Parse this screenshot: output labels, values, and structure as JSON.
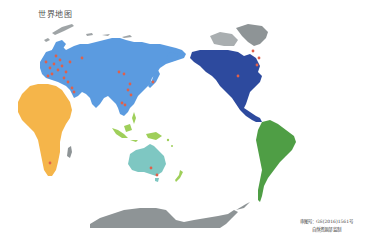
{
  "title": "世界地图",
  "footer": {
    "approval_number": "审图号：GS(2016)1561号",
    "publisher": "自然资源部 监制"
  },
  "colors": {
    "background": "#ffffff",
    "eurasia": "#5b9be0",
    "north_america": "#2d4a9e",
    "south_america": "#4f9e45",
    "africa": "#f5b54a",
    "oceania_australia": "#7ec7c2",
    "southeast_asia_islands": "#9fcf5a",
    "polar_ice": "#8e9496",
    "markers": "#e0604a"
  },
  "regions": [
    {
      "name": "Eurasia",
      "color_key": "eurasia"
    },
    {
      "name": "Africa",
      "color_key": "africa"
    },
    {
      "name": "North America",
      "color_key": "north_america"
    },
    {
      "name": "South America",
      "color_key": "south_america"
    },
    {
      "name": "Australia",
      "color_key": "oceania_australia"
    },
    {
      "name": "Southeast Asia / Pacific Islands",
      "color_key": "southeast_asia_islands"
    },
    {
      "name": "Greenland / Arctic",
      "color_key": "polar_ice"
    },
    {
      "name": "Antarctica",
      "color_key": "polar_ice"
    }
  ],
  "markers": [
    {
      "x": 46,
      "y": 62
    },
    {
      "x": 50,
      "y": 68
    },
    {
      "x": 54,
      "y": 64
    },
    {
      "x": 58,
      "y": 70
    },
    {
      "x": 62,
      "y": 66
    },
    {
      "x": 66,
      "y": 72
    },
    {
      "x": 60,
      "y": 60
    },
    {
      "x": 52,
      "y": 74
    },
    {
      "x": 70,
      "y": 62
    },
    {
      "x": 56,
      "y": 56
    },
    {
      "x": 64,
      "y": 78
    },
    {
      "x": 68,
      "y": 82
    },
    {
      "x": 48,
      "y": 76
    },
    {
      "x": 72,
      "y": 88
    },
    {
      "x": 74,
      "y": 92
    },
    {
      "x": 82,
      "y": 58
    },
    {
      "x": 119,
      "y": 72
    },
    {
      "x": 124,
      "y": 74
    },
    {
      "x": 130,
      "y": 84
    },
    {
      "x": 128,
      "y": 90
    },
    {
      "x": 131,
      "y": 95
    },
    {
      "x": 125,
      "y": 105
    },
    {
      "x": 153,
      "y": 82
    },
    {
      "x": 122,
      "y": 103
    },
    {
      "x": 50,
      "y": 163
    },
    {
      "x": 151,
      "y": 168
    },
    {
      "x": 157,
      "y": 175
    },
    {
      "x": 253,
      "y": 51
    },
    {
      "x": 259,
      "y": 58
    },
    {
      "x": 257,
      "y": 65
    },
    {
      "x": 238,
      "y": 76
    }
  ]
}
